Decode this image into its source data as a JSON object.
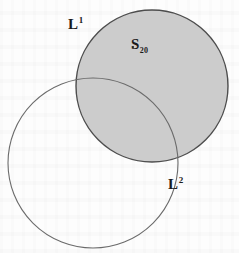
{
  "figure": {
    "background_color": "#fdfdfd",
    "labels": {
      "region_one_base": "L",
      "region_one_superscript": "1",
      "region_two_base": "L",
      "region_two_superscript": "2",
      "point_base": "S",
      "point_subscript": "20",
      "point_marker": "dot-marker"
    }
  },
  "chart_data": {
    "type": "diagram",
    "subtype": "venn-two-circle",
    "title": "",
    "xlabel": "",
    "ylabel": "",
    "grid": false,
    "legend": "none",
    "xlim": [
      0,
      239
    ],
    "ylim": [
      0,
      253
    ],
    "shapes": [
      {
        "name": "shaded-circle",
        "label": "L1",
        "cx": 152,
        "cy": 86,
        "r": 76,
        "fill": "#c9c9c9",
        "stroke": "#4d4d4d",
        "stroke_width": 1.4,
        "filled": true
      },
      {
        "name": "open-circle",
        "label": "L2",
        "cx": 93,
        "cy": 163,
        "r": 85,
        "fill": "none",
        "stroke": "#6b6b6b",
        "stroke_width": 1.1,
        "filled": false
      }
    ],
    "points": [
      {
        "name": "S20",
        "label": "S_20",
        "x": 133,
        "y": 47,
        "inside": "shaded-circle"
      }
    ],
    "annotations": [
      {
        "text": "L^1",
        "x": 75,
        "y": 24,
        "anchor": "outside-upper-left-of-shaded-circle"
      },
      {
        "text": "S_20",
        "x": 140,
        "y": 44,
        "anchor": "inside-shaded-circle"
      },
      {
        "text": "L^2",
        "x": 175,
        "y": 184,
        "anchor": "outside-lower-right-of-open-circle"
      }
    ],
    "colors": {
      "shaded_fill": "#c9c9c9",
      "shaded_stroke": "#4d4d4d",
      "open_stroke": "#6b6b6b",
      "text": "#1b1b1b",
      "background": "#fdfdfd"
    }
  }
}
